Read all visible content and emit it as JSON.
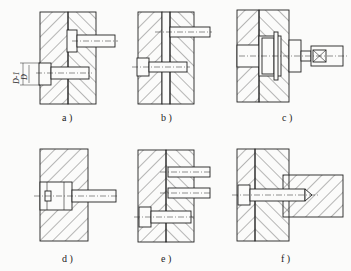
{
  "figure": {
    "panels": [
      {
        "id": "a",
        "caption": "a )",
        "dimension_labels": [
          "D-1",
          "D"
        ]
      },
      {
        "id": "b",
        "caption": "b )"
      },
      {
        "id": "c",
        "caption": "c )"
      },
      {
        "id": "d",
        "caption": "d )"
      },
      {
        "id": "e",
        "caption": "e )"
      },
      {
        "id": "f",
        "caption": "f )"
      }
    ]
  },
  "colors": {
    "line": "#222222",
    "background": "#fbfbfa"
  }
}
